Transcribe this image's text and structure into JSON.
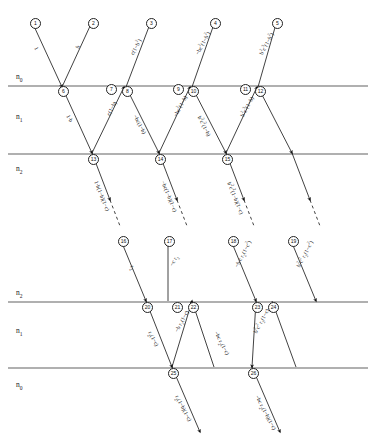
{
  "figure": {
    "type": "optical-ray-diagram"
  },
  "media": {
    "top_section": [
      {
        "id": "n0-top",
        "label": "n",
        "sub": "0"
      },
      {
        "id": "n1-top",
        "label": "n",
        "sub": "1"
      },
      {
        "id": "n2-top",
        "label": "n",
        "sub": "2"
      }
    ],
    "bottom_section": [
      {
        "id": "n2-bot",
        "label": "n",
        "sub": "2"
      },
      {
        "id": "n1-bot",
        "label": "n",
        "sub": "1"
      },
      {
        "id": "n0-bot",
        "label": "n",
        "sub": "0"
      }
    ]
  },
  "nodes": [
    {
      "n": "1",
      "x": 30,
      "y": 18
    },
    {
      "n": "2",
      "x": 88,
      "y": 18
    },
    {
      "n": "3",
      "x": 146,
      "y": 18
    },
    {
      "n": "4",
      "x": 210,
      "y": 18
    },
    {
      "n": "5",
      "x": 272,
      "y": 18
    },
    {
      "n": "6",
      "x": 58,
      "y": 86
    },
    {
      "n": "7",
      "x": 106,
      "y": 84
    },
    {
      "n": "8",
      "x": 122,
      "y": 86
    },
    {
      "n": "9",
      "x": 173,
      "y": 84
    },
    {
      "n": "10",
      "x": 188,
      "y": 86
    },
    {
      "n": "11",
      "x": 240,
      "y": 84
    },
    {
      "n": "12",
      "x": 255,
      "y": 86
    },
    {
      "n": "13",
      "x": 88,
      "y": 154
    },
    {
      "n": "14",
      "x": 155,
      "y": 154
    },
    {
      "n": "15",
      "x": 222,
      "y": 154
    },
    {
      "n": "16",
      "x": 118,
      "y": 236
    },
    {
      "n": "17",
      "x": 164,
      "y": 236
    },
    {
      "n": "18",
      "x": 228,
      "y": 236
    },
    {
      "n": "19",
      "x": 288,
      "y": 236
    },
    {
      "n": "20",
      "x": 142,
      "y": 302
    },
    {
      "n": "21",
      "x": 172,
      "y": 302
    },
    {
      "n": "22",
      "x": 188,
      "y": 302
    },
    {
      "n": "23",
      "x": 252,
      "y": 302
    },
    {
      "n": "24",
      "x": 268,
      "y": 302
    },
    {
      "n": "25",
      "x": 168,
      "y": 368
    },
    {
      "n": "26",
      "x": 248,
      "y": 368
    }
  ],
  "ray_labels": [
    {
      "id": "inc-1",
      "text": "1",
      "x": 36,
      "y": 44,
      "rot": 62
    },
    {
      "id": "refl-b",
      "text": "b",
      "x": 77,
      "y": 45,
      "rot": -62
    },
    {
      "id": "up-2",
      "text": "c(1&minus;b<sup>2</sup>)",
      "x": 131,
      "y": 50,
      "rot": -62
    },
    {
      "id": "up-3",
      "text": "&minus;bc<sup>2</sup>(1&minus;b<sup>2</sup>)",
      "x": 196,
      "y": 50,
      "rot": -62
    },
    {
      "id": "up-4",
      "text": "b<sup>2</sup>c<sup>3</sup>(1&minus;b<sup>2</sup>)",
      "x": 260,
      "y": 50,
      "rot": -62
    },
    {
      "id": "d-1b",
      "text": "1&middot;b",
      "x": 68,
      "y": 112,
      "rot": 62
    },
    {
      "id": "u-c1b",
      "text": "c(1&minus;b)",
      "x": 108,
      "y": 112,
      "rot": -62
    },
    {
      "id": "d-bc1b",
      "text": "&minus;bc(1&minus;b)",
      "x": 135,
      "y": 112,
      "rot": 62
    },
    {
      "id": "u-bc21b",
      "text": "&minus;bc<sup>2</sup>(1&minus;b)",
      "x": 174,
      "y": 112,
      "rot": -62
    },
    {
      "id": "d-b2c21b",
      "text": "b<sup>2</sup>c<sup>2</sup>(1&minus;b)",
      "x": 200,
      "y": 112,
      "rot": 62
    },
    {
      "id": "u-b2c31b",
      "text": "b<sup>2</sup>c<sup>3</sup>(1&minus;b)",
      "x": 241,
      "y": 112,
      "rot": -62
    },
    {
      "id": "t-1",
      "text": "1&middot;b(1&minus;b)(1&minus;c)",
      "x": 96,
      "y": 178,
      "rot": 68
    },
    {
      "id": "t-2",
      "text": "&minus;bc(1&minus;b)(1&minus;c)",
      "x": 163,
      "y": 178,
      "rot": 68
    },
    {
      "id": "t-3",
      "text": "b<sup>2</sup>c<sup>2</sup>(1&minus;b)(1&minus;c)",
      "x": 230,
      "y": 178,
      "rot": 68
    },
    {
      "id": "lo-r2",
      "text": "r<sub>2</sub>",
      "x": 131,
      "y": 262,
      "rot": 62
    },
    {
      "id": "lo-cr2",
      "text": "&minus;c r<sub>2</sub>",
      "x": 172,
      "y": 262,
      "rot": -62
    },
    {
      "id": "lo-bcr2",
      "text": "&minus;b c r<sub>2</sub>(1&minus;c<sup>2</sup>)",
      "x": 236,
      "y": 262,
      "rot": -62
    },
    {
      "id": "lo-b2c2r2",
      "text": "b<sup>2</sup>c<sup>2</sup> r<sub>2</sub>(1&minus;c<sup>2</sup>)",
      "x": 298,
      "y": 262,
      "rot": -62
    },
    {
      "id": "l2-r2",
      "text": "r<sub>2</sub>(1&minus;c)",
      "x": 149,
      "y": 328,
      "rot": 62
    },
    {
      "id": "l2-br2",
      "text": "&minus;b r<sub>2</sub>(1&minus;c)",
      "x": 177,
      "y": 328,
      "rot": -62
    },
    {
      "id": "l2-bcr2",
      "text": "&minus;bc r<sub>2</sub>(1&minus;c)",
      "x": 215,
      "y": 328,
      "rot": 62
    },
    {
      "id": "l2-b2c2r2",
      "text": "b<sup>2</sup>c<sup>2</sup> r<sub>2</sub>(1&minus;c)",
      "x": 255,
      "y": 328,
      "rot": -62
    },
    {
      "id": "b-r2",
      "text": "r<sub>2</sub>(1&minus;b)(1&minus;c)",
      "x": 176,
      "y": 392,
      "rot": 62
    },
    {
      "id": "b-bcr2",
      "text": "&minus;bc r<sub>2</sub>(1&minus;b)(1&minus;c)",
      "x": 256,
      "y": 392,
      "rot": 62
    }
  ],
  "interfaces": {
    "top_section_y": [
      86,
      154
    ],
    "bottom_section_y": [
      302,
      368
    ]
  }
}
